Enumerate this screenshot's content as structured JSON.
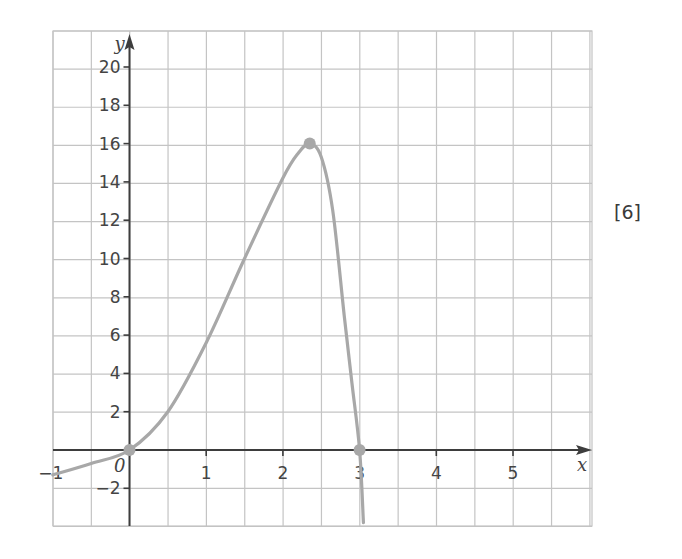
{
  "marks_label": "[6]",
  "colors": {
    "grid": "#c4c4c4",
    "axis": "#3d3d3d",
    "curve": "#a8a8a8",
    "points": "#a8a8a8",
    "text": "#444444"
  },
  "chart_data": {
    "type": "line",
    "title": "",
    "xlabel": "x",
    "ylabel": "y",
    "origin_label": "0",
    "xlim": [
      -1,
      5.6
    ],
    "ylim": [
      -4,
      22
    ],
    "grid": true,
    "grid_step_x": 0.5,
    "grid_step_y": 2,
    "x_ticks": [
      -1,
      1,
      2,
      3,
      4,
      5
    ],
    "y_ticks": [
      -2,
      2,
      4,
      6,
      8,
      10,
      12,
      14,
      16,
      18,
      20
    ],
    "series": [
      {
        "name": "curve",
        "x": [
          -1,
          -0.5,
          0,
          0.5,
          1,
          1.5,
          2,
          2.2,
          2.35,
          2.5,
          2.65,
          2.8,
          2.9,
          3,
          3.05
        ],
        "y": [
          -1.3,
          -0.7,
          0,
          2,
          5.6,
          10,
          14.2,
          15.5,
          16,
          15.3,
          12.5,
          7,
          3.5,
          0,
          -3.8
        ]
      }
    ],
    "marked_points": [
      {
        "x": 0,
        "y": 0
      },
      {
        "x": 2.35,
        "y": 16
      },
      {
        "x": 3,
        "y": 0
      }
    ]
  }
}
